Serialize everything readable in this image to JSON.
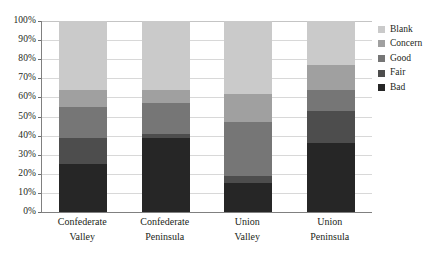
{
  "chart_data": {
    "type": "bar",
    "subtype": "stacked-bar-100-percent",
    "title": "",
    "xlabel": "",
    "ylabel": "",
    "ylim": [
      0,
      100
    ],
    "yunit": "%",
    "grid": true,
    "legend_position": "right",
    "categories": [
      "Confederate Valley",
      "Confederate Peninsula",
      "Union Valley",
      "Union Peninsula"
    ],
    "category_lines": [
      [
        "Confederate",
        "Valley"
      ],
      [
        "Confederate",
        "Peninsula"
      ],
      [
        "Union",
        "Valley"
      ],
      [
        "Union",
        "Peninsula"
      ]
    ],
    "ytick_labels": [
      "0%",
      "10%",
      "20%",
      "30%",
      "40%",
      "50%",
      "60%",
      "70%",
      "80%",
      "90%",
      "100%"
    ],
    "ytick_values": [
      0,
      10,
      20,
      30,
      40,
      50,
      60,
      70,
      80,
      90,
      100
    ],
    "series": [
      {
        "name": "Bad",
        "color": "#262626",
        "values": [
          25,
          39,
          15,
          36
        ]
      },
      {
        "name": "Fair",
        "color": "#4d4d4d",
        "values": [
          14,
          2,
          4,
          17
        ]
      },
      {
        "name": "Good",
        "color": "#767676",
        "values": [
          16,
          16,
          28,
          11
        ]
      },
      {
        "name": "Concern",
        "color": "#a0a0a0",
        "values": [
          9,
          7,
          15,
          13
        ]
      },
      {
        "name": "Blank",
        "color": "#cacaca",
        "values": [
          36,
          36,
          38,
          23
        ]
      }
    ],
    "legend_entries": [
      {
        "label": "Blank",
        "color": "#cacaca"
      },
      {
        "label": "Concern",
        "color": "#a0a0a0"
      },
      {
        "label": "Good",
        "color": "#767676"
      },
      {
        "label": "Fair",
        "color": "#4d4d4d"
      },
      {
        "label": "Bad",
        "color": "#262626"
      }
    ],
    "cumulative_tops": {
      "Confederate Valley": {
        "Bad": 25,
        "Fair": 39,
        "Good": 55,
        "Concern": 64,
        "Blank": 100
      },
      "Confederate Peninsula": {
        "Bad": 39,
        "Fair": 41,
        "Good": 57,
        "Concern": 64,
        "Blank": 100
      },
      "Union Valley": {
        "Bad": 15,
        "Fair": 19,
        "Good": 47,
        "Concern": 62,
        "Blank": 100
      },
      "Union Peninsula": {
        "Bad": 36,
        "Fair": 53,
        "Good": 64,
        "Concern": 77,
        "Blank": 100
      }
    }
  },
  "colors": {
    "axis": "#808080",
    "gridline": "#d8d8d8",
    "text": "#231f20",
    "background": "#ffffff"
  }
}
